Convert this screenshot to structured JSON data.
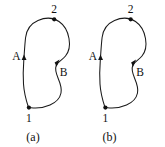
{
  "figure": {
    "background_color": "#ffffff",
    "stroke_color": "#1a1a1a",
    "marker_color": "#111111",
    "panels": [
      {
        "id": "a",
        "caption": "(a)",
        "nodes": [
          {
            "id": "node-1",
            "label": "1",
            "position": "bottom-left"
          },
          {
            "id": "node-2",
            "label": "2",
            "position": "top"
          }
        ],
        "paths": [
          {
            "id": "path-A",
            "label": "A",
            "side": "left",
            "arrow_direction": "up"
          },
          {
            "id": "path-B",
            "label": "B",
            "side": "right-notch",
            "arrow_direction": "up-right"
          }
        ]
      },
      {
        "id": "b",
        "caption": "(b)",
        "nodes": [
          {
            "id": "node-1",
            "label": "1",
            "position": "bottom-left"
          },
          {
            "id": "node-2",
            "label": "2",
            "position": "top"
          }
        ],
        "paths": [
          {
            "id": "path-A",
            "label": "A",
            "side": "left",
            "arrow_direction": "up"
          },
          {
            "id": "path-B",
            "label": "B",
            "side": "right-notch",
            "arrow_direction": "up-right"
          }
        ]
      }
    ]
  }
}
